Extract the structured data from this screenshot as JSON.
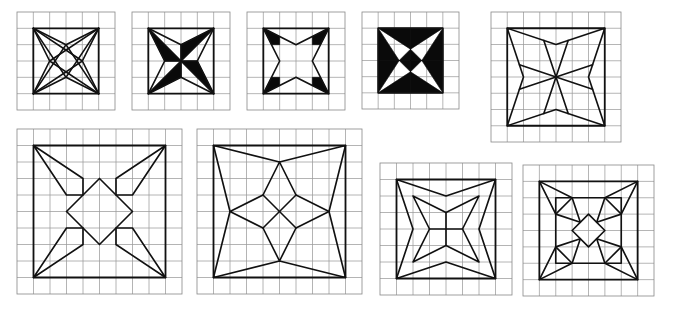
{
  "figure": {
    "colors": {
      "line": "#111111",
      "fill": "#0a0a0a",
      "grid": "#9a9a9a",
      "background": "#ffffff"
    }
  },
  "tiles": [
    {
      "id": "tile-1",
      "grid": 6,
      "x": 17,
      "y": 12,
      "size": 98,
      "frame": [
        [
          1,
          1
        ],
        [
          5,
          1
        ],
        [
          5,
          5
        ],
        [
          1,
          5
        ]
      ],
      "lines": [
        [
          [
            1,
            1
          ],
          [
            3,
            2
          ],
          [
            5,
            1
          ]
        ],
        [
          [
            5,
            1
          ],
          [
            4,
            3
          ],
          [
            5,
            5
          ]
        ],
        [
          [
            5,
            5
          ],
          [
            3,
            4
          ],
          [
            1,
            5
          ]
        ],
        [
          [
            1,
            5
          ],
          [
            2,
            3
          ],
          [
            1,
            1
          ]
        ],
        [
          [
            1,
            1
          ],
          [
            4,
            3
          ],
          [
            1,
            5
          ]
        ],
        [
          [
            5,
            1
          ],
          [
            2,
            3
          ],
          [
            5,
            5
          ]
        ],
        [
          [
            1,
            1
          ],
          [
            3,
            4
          ],
          [
            5,
            1
          ]
        ],
        [
          [
            1,
            5
          ],
          [
            3,
            2
          ],
          [
            5,
            5
          ]
        ]
      ],
      "fills": []
    },
    {
      "id": "tile-2",
      "grid": 6,
      "x": 132,
      "y": 12,
      "size": 98,
      "frame": [
        [
          1,
          1
        ],
        [
          5,
          1
        ],
        [
          5,
          5
        ],
        [
          1,
          5
        ]
      ],
      "lines": [
        [
          [
            1,
            1
          ],
          [
            3,
            2
          ],
          [
            5,
            1
          ],
          [
            4,
            3
          ],
          [
            5,
            5
          ],
          [
            3,
            4
          ],
          [
            1,
            5
          ],
          [
            2,
            3
          ],
          [
            1,
            1
          ]
        ],
        [
          [
            1,
            1
          ],
          [
            3,
            3
          ],
          [
            5,
            5
          ]
        ],
        [
          [
            5,
            1
          ],
          [
            3,
            3
          ],
          [
            1,
            5
          ]
        ],
        [
          [
            3,
            2
          ],
          [
            3,
            3
          ],
          [
            4,
            3
          ]
        ],
        [
          [
            3,
            4
          ],
          [
            3,
            3
          ],
          [
            2,
            3
          ]
        ]
      ],
      "fills": [
        [
          [
            1,
            1
          ],
          [
            2,
            3
          ],
          [
            3,
            3
          ]
        ],
        [
          [
            5,
            1
          ],
          [
            3,
            2
          ],
          [
            3,
            3
          ]
        ],
        [
          [
            5,
            5
          ],
          [
            4,
            3
          ],
          [
            3,
            3
          ]
        ],
        [
          [
            1,
            5
          ],
          [
            3,
            4
          ],
          [
            3,
            3
          ]
        ]
      ]
    },
    {
      "id": "tile-3",
      "grid": 6,
      "x": 247,
      "y": 12,
      "size": 98,
      "frame": [
        [
          1,
          1
        ],
        [
          5,
          1
        ],
        [
          5,
          5
        ],
        [
          1,
          5
        ]
      ],
      "lines": [
        [
          [
            1,
            1
          ],
          [
            3,
            2
          ],
          [
            5,
            1
          ],
          [
            4,
            3
          ],
          [
            5,
            5
          ],
          [
            3,
            4
          ],
          [
            1,
            5
          ],
          [
            2,
            3
          ],
          [
            1,
            1
          ]
        ]
      ],
      "fills": [
        [
          [
            1,
            1
          ],
          [
            2,
            1.5
          ],
          [
            2,
            2
          ],
          [
            1.5,
            2
          ]
        ],
        [
          [
            5,
            1
          ],
          [
            4.5,
            2
          ],
          [
            4,
            2
          ],
          [
            4,
            1.5
          ]
        ],
        [
          [
            5,
            5
          ],
          [
            4,
            4.5
          ],
          [
            4,
            4
          ],
          [
            4.5,
            4
          ]
        ],
        [
          [
            1,
            5
          ],
          [
            1.5,
            4
          ],
          [
            2,
            4
          ],
          [
            2,
            4.5
          ]
        ]
      ]
    },
    {
      "id": "tile-4",
      "grid": 6,
      "x": 362,
      "y": 12,
      "size": 97,
      "frame": [
        [
          1,
          1
        ],
        [
          5,
          1
        ],
        [
          5,
          5
        ],
        [
          1,
          5
        ]
      ],
      "lines": [],
      "fills": [
        [
          [
            3,
            1
          ],
          [
            5,
            1
          ],
          [
            3,
            2.3
          ]
        ],
        [
          [
            5,
            1
          ],
          [
            5,
            3
          ],
          [
            3.7,
            3
          ]
        ],
        [
          [
            3,
            2.3
          ],
          [
            3.7,
            3
          ],
          [
            3,
            3
          ]
        ],
        [
          [
            5,
            3
          ],
          [
            5,
            5
          ],
          [
            3.7,
            3
          ]
        ],
        [
          [
            5,
            5
          ],
          [
            3,
            5
          ],
          [
            3,
            3.7
          ]
        ],
        [
          [
            3.7,
            3
          ],
          [
            3,
            3.7
          ],
          [
            3,
            3
          ]
        ],
        [
          [
            3,
            5
          ],
          [
            1,
            5
          ],
          [
            3,
            3.7
          ]
        ],
        [
          [
            1,
            5
          ],
          [
            1,
            3
          ],
          [
            2.3,
            3
          ]
        ],
        [
          [
            3,
            3.7
          ],
          [
            2.3,
            3
          ],
          [
            3,
            3
          ]
        ],
        [
          [
            1,
            3
          ],
          [
            1,
            1
          ],
          [
            2.3,
            3
          ]
        ],
        [
          [
            1,
            1
          ],
          [
            3,
            1
          ],
          [
            3,
            2.3
          ]
        ],
        [
          [
            2.3,
            3
          ],
          [
            3,
            2.3
          ],
          [
            3,
            3
          ]
        ]
      ]
    },
    {
      "id": "tile-5",
      "grid": 8,
      "x": 491,
      "y": 12,
      "size": 130,
      "frame": [
        [
          1,
          1
        ],
        [
          7,
          1
        ],
        [
          7,
          7
        ],
        [
          1,
          7
        ]
      ],
      "lines": [
        [
          [
            1,
            1
          ],
          [
            4,
            2
          ],
          [
            7,
            1
          ],
          [
            6,
            4
          ],
          [
            7,
            7
          ],
          [
            4,
            6
          ],
          [
            1,
            7
          ],
          [
            2,
            4
          ],
          [
            1,
            1
          ]
        ],
        [
          [
            3.25,
            1.75
          ],
          [
            4.75,
            6.25
          ]
        ],
        [
          [
            4.75,
            1.75
          ],
          [
            3.25,
            6.25
          ]
        ],
        [
          [
            1.75,
            3.25
          ],
          [
            6.25,
            4.75
          ]
        ],
        [
          [
            6.25,
            3.25
          ],
          [
            1.75,
            4.75
          ]
        ]
      ],
      "fills": []
    },
    {
      "id": "tile-6",
      "grid": 10,
      "x": 17,
      "y": 129,
      "size": 165,
      "frame": [
        [
          1,
          1
        ],
        [
          9,
          1
        ],
        [
          9,
          9
        ],
        [
          1,
          9
        ]
      ],
      "lines": [
        [
          [
            5,
            3
          ],
          [
            7,
            5
          ],
          [
            5,
            7
          ],
          [
            3,
            5
          ],
          [
            5,
            3
          ]
        ],
        [
          [
            1,
            1
          ],
          [
            4,
            3
          ],
          [
            4,
            4
          ],
          [
            3,
            4
          ],
          [
            1,
            1
          ]
        ],
        [
          [
            9,
            1
          ],
          [
            6,
            3
          ],
          [
            6,
            4
          ],
          [
            7,
            4
          ],
          [
            9,
            1
          ]
        ],
        [
          [
            9,
            9
          ],
          [
            6,
            7
          ],
          [
            6,
            6
          ],
          [
            7,
            6
          ],
          [
            9,
            9
          ]
        ],
        [
          [
            1,
            9
          ],
          [
            4,
            7
          ],
          [
            4,
            6
          ],
          [
            3,
            6
          ],
          [
            1,
            9
          ]
        ]
      ],
      "fills": []
    },
    {
      "id": "tile-7",
      "grid": 10,
      "x": 197,
      "y": 129,
      "size": 165,
      "frame": [
        [
          1,
          1
        ],
        [
          9,
          1
        ],
        [
          9,
          9
        ],
        [
          1,
          9
        ]
      ],
      "lines": [
        [
          [
            1,
            1
          ],
          [
            5,
            2
          ],
          [
            9,
            1
          ],
          [
            8,
            5
          ],
          [
            9,
            9
          ],
          [
            5,
            8
          ],
          [
            1,
            9
          ],
          [
            2,
            5
          ],
          [
            1,
            1
          ]
        ],
        [
          [
            5,
            2
          ],
          [
            4,
            4
          ],
          [
            2,
            5
          ],
          [
            4,
            6
          ],
          [
            5,
            8
          ],
          [
            6,
            6
          ],
          [
            8,
            5
          ],
          [
            6,
            4
          ],
          [
            5,
            2
          ]
        ],
        [
          [
            4,
            4
          ],
          [
            6,
            6
          ]
        ],
        [
          [
            6,
            4
          ],
          [
            4,
            6
          ]
        ]
      ],
      "fills": []
    },
    {
      "id": "tile-8",
      "grid": 8,
      "x": 380,
      "y": 163,
      "size": 132,
      "frame": [
        [
          1,
          1
        ],
        [
          7,
          1
        ],
        [
          7,
          7
        ],
        [
          1,
          7
        ]
      ],
      "lines": [
        [
          [
            1,
            1
          ],
          [
            4,
            2
          ],
          [
            7,
            1
          ],
          [
            6,
            4
          ],
          [
            7,
            7
          ],
          [
            4,
            6
          ],
          [
            1,
            7
          ],
          [
            2,
            4
          ],
          [
            1,
            1
          ]
        ],
        [
          [
            2,
            2
          ],
          [
            4,
            3
          ],
          [
            6,
            2
          ],
          [
            5,
            4
          ],
          [
            6,
            6
          ],
          [
            4,
            5
          ],
          [
            2,
            6
          ],
          [
            3,
            4
          ],
          [
            2,
            2
          ]
        ],
        [
          [
            4,
            3
          ],
          [
            4,
            5
          ]
        ],
        [
          [
            3,
            4
          ],
          [
            5,
            4
          ]
        ]
      ],
      "fills": []
    },
    {
      "id": "tile-9",
      "grid": 8,
      "x": 523,
      "y": 165,
      "size": 131,
      "frame": [
        [
          1,
          1
        ],
        [
          7,
          1
        ],
        [
          7,
          7
        ],
        [
          1,
          7
        ]
      ],
      "lines": [
        [
          [
            2,
            2
          ],
          [
            6,
            2
          ],
          [
            6,
            6
          ],
          [
            2,
            6
          ],
          [
            2,
            2
          ]
        ],
        [
          [
            4,
            3
          ],
          [
            5,
            4
          ],
          [
            4,
            5
          ],
          [
            3,
            4
          ],
          [
            4,
            3
          ]
        ],
        [
          [
            1,
            1
          ],
          [
            3,
            2
          ],
          [
            3.5,
            3.5
          ],
          [
            2,
            3
          ],
          [
            1,
            1
          ]
        ],
        [
          [
            3,
            2
          ],
          [
            2,
            3
          ]
        ],
        [
          [
            7,
            1
          ],
          [
            5,
            2
          ],
          [
            4.5,
            3.5
          ],
          [
            6,
            3
          ],
          [
            7,
            1
          ]
        ],
        [
          [
            5,
            2
          ],
          [
            6,
            3
          ]
        ],
        [
          [
            7,
            7
          ],
          [
            5,
            6
          ],
          [
            4.5,
            4.5
          ],
          [
            6,
            5
          ],
          [
            7,
            7
          ]
        ],
        [
          [
            5,
            6
          ],
          [
            6,
            5
          ]
        ],
        [
          [
            1,
            7
          ],
          [
            3,
            6
          ],
          [
            3.5,
            4.5
          ],
          [
            2,
            5
          ],
          [
            1,
            7
          ]
        ],
        [
          [
            3,
            6
          ],
          [
            2,
            5
          ]
        ]
      ],
      "fills": []
    }
  ]
}
